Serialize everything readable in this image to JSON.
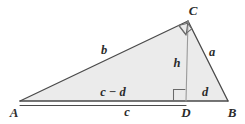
{
  "figure": {
    "type": "geometry-diagram",
    "colors": {
      "fill": "#ebebeb",
      "stroke": "#4a4a4a",
      "altitude_stroke": "#9a9a9a",
      "text": "#2b2b2b",
      "background": "#ffffff"
    },
    "vertices": [
      {
        "name": "A",
        "label": "A",
        "x": 20,
        "y": 101,
        "label_x": 14,
        "label_y": 112
      },
      {
        "name": "B",
        "label": "B",
        "x": 228,
        "y": 101,
        "label_x": 232,
        "label_y": 112
      },
      {
        "name": "C",
        "label": "C",
        "x": 188,
        "y": 21,
        "label_x": 193,
        "label_y": 10
      },
      {
        "name": "D",
        "label": "D",
        "x": 186,
        "y": 101,
        "label_x": 186,
        "label_y": 112
      }
    ],
    "sides": [
      {
        "name": "side-b",
        "label": "b",
        "from": "A",
        "to": "C",
        "label_x": 104,
        "label_y": 50
      },
      {
        "name": "side-a",
        "label": "a",
        "from": "C",
        "to": "B",
        "label_x": 212,
        "label_y": 52
      },
      {
        "name": "altitude-h",
        "label": "h",
        "from": "C",
        "to": "D",
        "label_x": 177,
        "label_y": 63
      }
    ],
    "segments": [
      {
        "name": "segment-c-minus-d",
        "label": "c − d",
        "label_x": 113,
        "label_y": 92
      },
      {
        "name": "segment-c",
        "label": "c",
        "label_x": 127,
        "label_y": 111
      },
      {
        "name": "segment-d",
        "label": "d",
        "label_x": 205,
        "label_y": 92
      }
    ],
    "right_angles": [
      {
        "name": "right-angle-at-c",
        "at": "C"
      },
      {
        "name": "right-angle-at-d",
        "at": "D"
      }
    ]
  }
}
